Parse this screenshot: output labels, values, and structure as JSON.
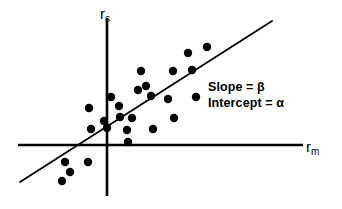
{
  "figure": {
    "title": "",
    "background_color": "#ffffff",
    "ink_color": "#000000",
    "width": 342,
    "height": 209
  },
  "axes": {
    "y_axis": {
      "label_base": "r",
      "label_sub": "s",
      "name": "security-return"
    },
    "x_axis": {
      "label_base": "r",
      "label_sub": "m",
      "name": "market-return"
    }
  },
  "annotations": {
    "slope_label": "Slope = β",
    "intercept_label": "Intercept = α"
  },
  "chart_data": {
    "type": "scatter",
    "title": "",
    "xlabel": "r_m",
    "ylabel": "r_s",
    "grid": false,
    "legend": false,
    "axis_style": "crossed-origin-arrows",
    "origin_px": [
      107,
      145
    ],
    "xlim_px": [
      18,
      303
    ],
    "ylim_px": [
      196,
      18
    ],
    "notes": [
      "Characteristic line / market model regression of security return on market return",
      "Slope of fitted line is beta, intercept is alpha"
    ],
    "fit_line": {
      "name": "regression-line",
      "x1_px": 20,
      "y1_px": 182,
      "x2_px": 272,
      "y2_px": 21,
      "slope_px": -0.639,
      "intercept_label": "α",
      "slope_label": "β"
    },
    "points_px": [
      [
        65,
        162
      ],
      [
        62,
        181
      ],
      [
        70,
        172
      ],
      [
        88,
        162
      ],
      [
        89,
        108
      ],
      [
        91,
        129
      ],
      [
        107,
        128
      ],
      [
        104,
        121
      ],
      [
        119,
        106
      ],
      [
        120,
        117
      ],
      [
        127,
        130
      ],
      [
        128,
        142
      ],
      [
        138,
        90
      ],
      [
        141,
        71
      ],
      [
        146,
        86
      ],
      [
        151,
        96
      ],
      [
        153,
        129
      ],
      [
        168,
        99
      ],
      [
        173,
        71
      ],
      [
        188,
        53
      ],
      [
        192,
        70
      ],
      [
        196,
        97
      ],
      [
        207,
        47
      ],
      [
        174,
        118
      ],
      [
        132,
        118
      ],
      [
        111,
        97
      ]
    ],
    "point_count": 26,
    "point_radius_px": 4.2
  }
}
